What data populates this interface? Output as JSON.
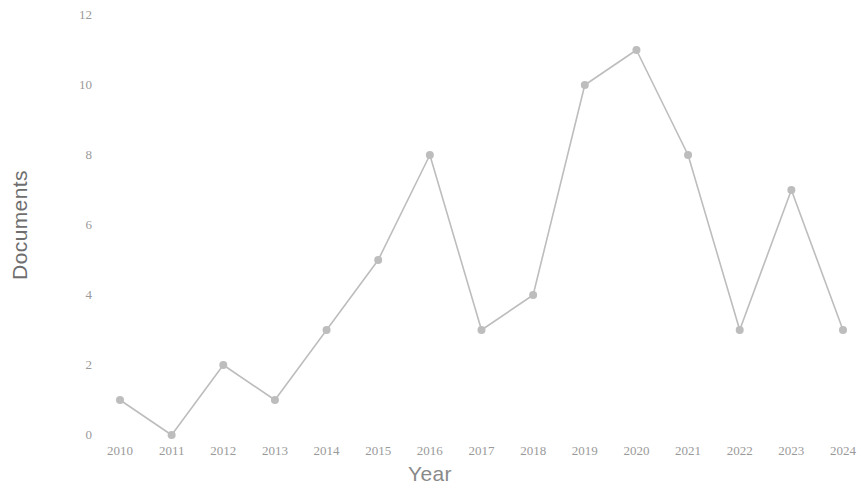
{
  "chart_data": {
    "type": "line",
    "title": "",
    "xlabel": "Year",
    "ylabel": "Documents",
    "categories": [
      "2010",
      "2011",
      "2012",
      "2013",
      "2014",
      "2015",
      "2016",
      "2017",
      "2018",
      "2019",
      "2020",
      "2021",
      "2022",
      "2023",
      "2024"
    ],
    "values": [
      1,
      0,
      2,
      1,
      3,
      5,
      8,
      3,
      4,
      10,
      11,
      8,
      3,
      7,
      3
    ],
    "series": [
      {
        "name": "Documents",
        "values": [
          1,
          0,
          2,
          1,
          3,
          5,
          8,
          3,
          4,
          10,
          11,
          8,
          3,
          7,
          3
        ]
      }
    ],
    "ytick_labels": [
      "0",
      "2",
      "4",
      "6",
      "8",
      "10",
      "12"
    ],
    "ytick_values": [
      0,
      2,
      4,
      6,
      8,
      10,
      12
    ],
    "xtick_labels": [
      "2010",
      "2011",
      "2012",
      "2013",
      "2014",
      "2015",
      "2016",
      "2017",
      "2018",
      "2019",
      "2020",
      "2021",
      "2022",
      "2023",
      "2024"
    ],
    "ylim": [
      0,
      12
    ],
    "xlim": [
      2010,
      2024
    ],
    "grid": false,
    "legend": false,
    "legend_position": "none",
    "line_color": "#bdbdbd",
    "marker_color": "#bdbdbd",
    "marker_shape": "circle",
    "background_color": "#ffffff",
    "axis_label_color": "#6e6e6e",
    "tick_label_color": "#9a9a9a"
  }
}
